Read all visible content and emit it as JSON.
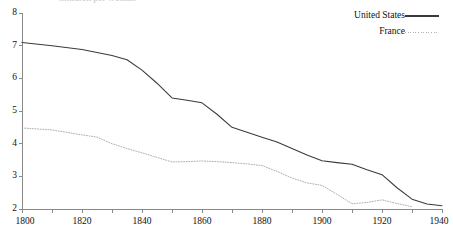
{
  "figure": {
    "clipped_title": "Children per woman",
    "background": "#ffffff",
    "axis_color": "#8a8a8a",
    "text_color": "#111111"
  },
  "legend": {
    "position": "top-right",
    "entries": [
      {
        "label": "United States",
        "style": "solid",
        "color": "#3a3a3a"
      },
      {
        "label": "France",
        "style": "dotted",
        "color": "#b0b0b0"
      }
    ]
  },
  "chart_data": {
    "type": "line",
    "title": "Children per woman",
    "xlabel": "",
    "ylabel": "",
    "xlim": [
      1800,
      1940
    ],
    "ylim": [
      2,
      8
    ],
    "xticks": [
      1800,
      1810,
      1820,
      1830,
      1840,
      1850,
      1860,
      1870,
      1880,
      1890,
      1900,
      1910,
      1920,
      1930,
      1940
    ],
    "xtick_labels": [
      "1800",
      "1820",
      "1840",
      "1860",
      "1880",
      "1900",
      "1920",
      "1940"
    ],
    "xtick_labeled_values": [
      1800,
      1820,
      1840,
      1860,
      1880,
      1900,
      1920,
      1940
    ],
    "yticks": [
      2,
      3,
      4,
      5,
      6,
      7,
      8
    ],
    "ytick_labels": [
      "2",
      "3",
      "4",
      "5",
      "6",
      "7",
      "8"
    ],
    "grid": false,
    "legend_position": "top-right",
    "series": [
      {
        "name": "United States",
        "style": "solid",
        "color": "#3a3a3a",
        "x": [
          1800,
          1810,
          1820,
          1830,
          1835,
          1840,
          1845,
          1850,
          1855,
          1860,
          1865,
          1870,
          1875,
          1880,
          1885,
          1890,
          1895,
          1900,
          1905,
          1910,
          1915,
          1920,
          1925,
          1930,
          1935,
          1940
        ],
        "values": [
          7.1,
          7.0,
          6.88,
          6.7,
          6.57,
          6.25,
          5.85,
          5.4,
          5.33,
          5.25,
          4.9,
          4.5,
          4.35,
          4.2,
          4.05,
          3.85,
          3.65,
          3.48,
          3.42,
          3.37,
          3.2,
          3.05,
          2.65,
          2.3,
          2.15,
          2.1
        ]
      },
      {
        "name": "France",
        "style": "dotted",
        "color": "#b0b0b0",
        "x": [
          1800,
          1810,
          1820,
          1825,
          1830,
          1835,
          1840,
          1845,
          1850,
          1855,
          1860,
          1865,
          1870,
          1875,
          1880,
          1885,
          1890,
          1895,
          1900,
          1905,
          1910,
          1915,
          1920,
          1925,
          1930
        ],
        "values": [
          4.48,
          4.42,
          4.27,
          4.2,
          4.0,
          3.85,
          3.72,
          3.58,
          3.44,
          3.45,
          3.47,
          3.45,
          3.42,
          3.38,
          3.33,
          3.15,
          2.95,
          2.8,
          2.72,
          2.45,
          2.16,
          2.2,
          2.28,
          2.17,
          2.07
        ]
      }
    ]
  }
}
